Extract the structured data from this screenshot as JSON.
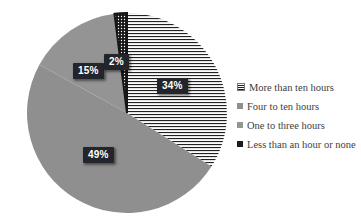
{
  "chart_data": {
    "type": "pie",
    "title": "",
    "start_angle_deg": 0,
    "direction": "clockwise",
    "legend_position": "right",
    "slices": [
      {
        "category": "More than ten hours",
        "value": 34,
        "label": "34%",
        "fill": "horizontal-stripes"
      },
      {
        "category": "Four to ten hours",
        "value": 49,
        "label": "49%",
        "fill": "solid-gray"
      },
      {
        "category": "One to three hours",
        "value": 15,
        "label": "15%",
        "fill": "solid-gray-light"
      },
      {
        "category": "Less than an hour or none",
        "value": 2,
        "label": "2%",
        "fill": "black-white-dots"
      }
    ]
  },
  "legend": {
    "items": [
      {
        "label": "More than ten hours",
        "marker": "horizontal-stripes"
      },
      {
        "label": "Four to ten hours",
        "marker": "solid-gray"
      },
      {
        "label": "One to three hours",
        "marker": "solid-gray-light"
      },
      {
        "label": "Less than an hour or none",
        "marker": "solid-black"
      }
    ]
  },
  "colors": {
    "gray": "#8f8f8f",
    "gray_light": "#949494",
    "stripe_line": "#222222",
    "stripe_bg": "#fbfbfb",
    "dot_bg": "#161616",
    "dot_fill": "#ffffff",
    "label_bg": "#22252c",
    "label_text": "#ffffff",
    "black": "#1c1c1c",
    "legend_text": "#3e3e3e"
  }
}
